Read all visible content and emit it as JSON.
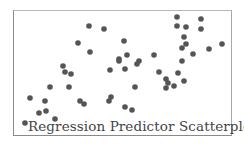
{
  "chart_data": {
    "type": "scatter",
    "title": "Regression Predictor Scatterplot",
    "xlabel": "",
    "ylabel": "",
    "grid": false,
    "legend": null,
    "axes_ticks": "none",
    "marker_color": "#555555",
    "points_px": [
      [
        25,
        123
      ],
      [
        30,
        98
      ],
      [
        39,
        113
      ],
      [
        45,
        101
      ],
      [
        46,
        111
      ],
      [
        50,
        87
      ],
      [
        55,
        119
      ],
      [
        63,
        66
      ],
      [
        65,
        72
      ],
      [
        71,
        74
      ],
      [
        69,
        87
      ],
      [
        78,
        43
      ],
      [
        80,
        101
      ],
      [
        84,
        104
      ],
      [
        89,
        26
      ],
      [
        90,
        52
      ],
      [
        104,
        29
      ],
      [
        110,
        70
      ],
      [
        109,
        101
      ],
      [
        111,
        97
      ],
      [
        119,
        59
      ],
      [
        119,
        61
      ],
      [
        124,
        41
      ],
      [
        125,
        69
      ],
      [
        127,
        55
      ],
      [
        125,
        107
      ],
      [
        132,
        110
      ],
      [
        135,
        87
      ],
      [
        137,
        64
      ],
      [
        139,
        61
      ],
      [
        154,
        55
      ],
      [
        159,
        72
      ],
      [
        166,
        79
      ],
      [
        168,
        83
      ],
      [
        166,
        88
      ],
      [
        174,
        86
      ],
      [
        177,
        17
      ],
      [
        177,
        26
      ],
      [
        178,
        73
      ],
      [
        182,
        61
      ],
      [
        182,
        48
      ],
      [
        184,
        37
      ],
      [
        186,
        27
      ],
      [
        186,
        44
      ],
      [
        184,
        81
      ],
      [
        193,
        54
      ],
      [
        201,
        19
      ],
      [
        201,
        29
      ],
      [
        209,
        49
      ],
      [
        222,
        44
      ]
    ]
  }
}
